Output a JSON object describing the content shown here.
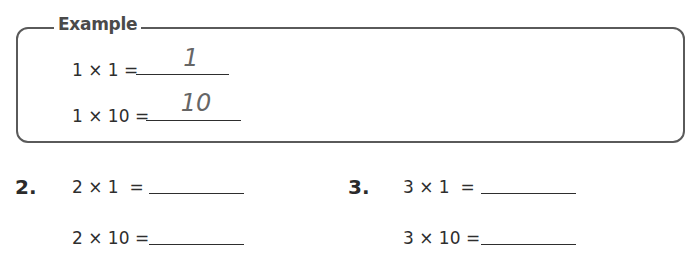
{
  "example": {
    "title": "Example",
    "rows": [
      {
        "expression": "1 × 1 =",
        "answer": "1"
      },
      {
        "expression": "1 × 10 =",
        "answer": "10"
      }
    ]
  },
  "problems": [
    {
      "number": "2.",
      "rows": [
        {
          "expression": "2 × 1  =",
          "answer": ""
        },
        {
          "expression": "2 × 10 =",
          "answer": ""
        }
      ]
    },
    {
      "number": "3.",
      "rows": [
        {
          "expression": "3 × 1  =",
          "answer": ""
        },
        {
          "expression": "3 × 10 =",
          "answer": ""
        }
      ]
    }
  ],
  "colors": {
    "border": "#5a5a5a",
    "text": "#2e2e2e",
    "handwritten_answer": "#666666"
  }
}
